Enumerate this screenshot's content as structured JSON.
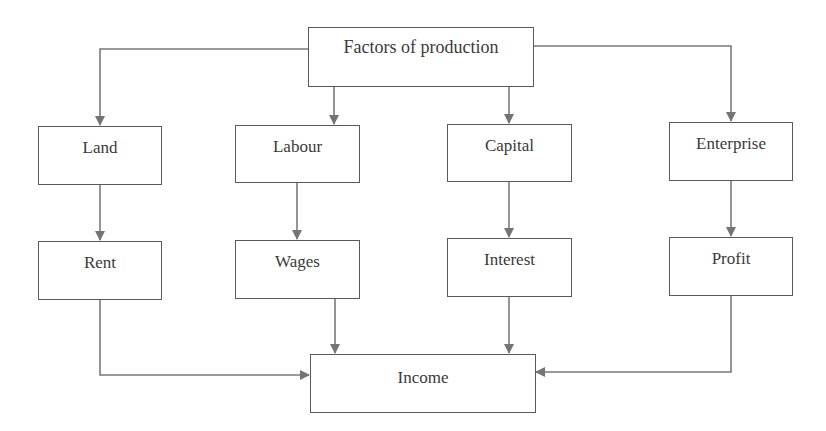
{
  "diagram": {
    "root": {
      "label": "Factors of production"
    },
    "factors": [
      {
        "label": "Land"
      },
      {
        "label": "Labour"
      },
      {
        "label": "Capital"
      },
      {
        "label": "Enterprise"
      }
    ],
    "rewards": [
      {
        "label": "Rent"
      },
      {
        "label": "Wages"
      },
      {
        "label": "Interest"
      },
      {
        "label": "Profit"
      }
    ],
    "sink": {
      "label": "Income"
    },
    "colors": {
      "line": "#7a7a7a",
      "border": "#5a5a5a",
      "text": "#3a3a3a"
    }
  }
}
